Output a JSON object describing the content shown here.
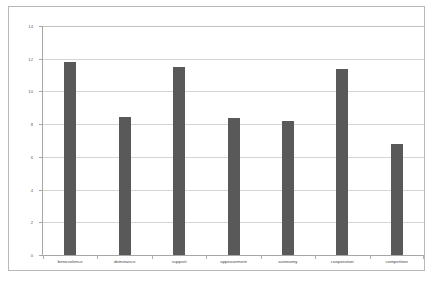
{
  "chart_data": {
    "type": "bar",
    "title": "",
    "xlabel": "",
    "ylabel": "",
    "ylim": [
      0,
      14
    ],
    "ytick_step": 2,
    "yticks": [
      0,
      2,
      4,
      6,
      8,
      10,
      12,
      14
    ],
    "ytick_labels": [
      "0",
      "2",
      "4",
      "6",
      "8",
      "10",
      "12",
      "14"
    ],
    "grid": true,
    "legend": false,
    "legend_position": "none",
    "bar_color": "#595959",
    "gridline_color": "#d4d4d4",
    "axis_color": "#a6a6a6",
    "background_color": "#ffffff",
    "categories": [
      "benevolence",
      "dominance",
      "support",
      "appeasement",
      "autonomy",
      "cooperation",
      "competition"
    ],
    "values": [
      11.8,
      8.45,
      11.5,
      8.35,
      8.2,
      11.35,
      6.8
    ]
  }
}
